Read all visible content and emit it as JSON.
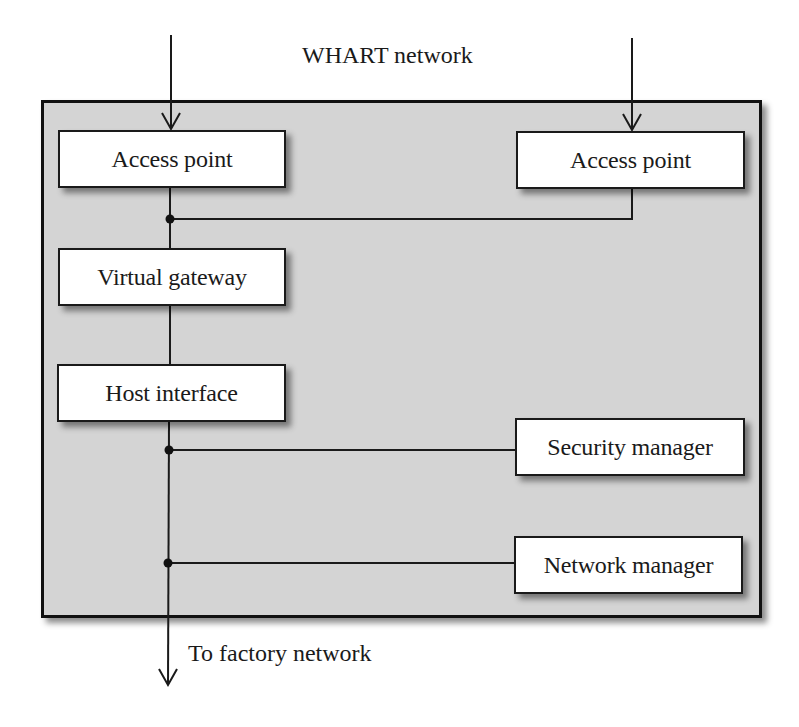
{
  "diagram": {
    "title_label": "WHART network",
    "output_label": "To factory network",
    "colors": {
      "container_fill": "#d4d4d4",
      "container_border": "#111111",
      "node_fill": "#ffffff",
      "line": "#1a1a1a"
    },
    "nodes": [
      {
        "id": "access-point-1",
        "label": "Access point"
      },
      {
        "id": "access-point-2",
        "label": "Access point"
      },
      {
        "id": "virtual-gateway",
        "label": "Virtual gateway"
      },
      {
        "id": "host-interface",
        "label": "Host interface"
      },
      {
        "id": "security-manager",
        "label": "Security manager"
      },
      {
        "id": "network-manager",
        "label": "Network manager"
      }
    ],
    "edges": [
      {
        "from": "WHART network",
        "to": "access-point-1",
        "type": "arrow"
      },
      {
        "from": "WHART network",
        "to": "access-point-2",
        "type": "arrow"
      },
      {
        "from": "access-point-1",
        "to": "virtual-gateway",
        "type": "line"
      },
      {
        "from": "access-point-2",
        "to": "virtual-gateway",
        "type": "line-junction"
      },
      {
        "from": "virtual-gateway",
        "to": "host-interface",
        "type": "line"
      },
      {
        "from": "host-interface",
        "to": "security-manager",
        "type": "line-junction"
      },
      {
        "from": "host-interface",
        "to": "network-manager",
        "type": "line-junction"
      },
      {
        "from": "host-interface",
        "to": "To factory network",
        "type": "arrow"
      }
    ]
  }
}
